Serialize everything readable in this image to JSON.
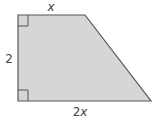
{
  "diagram": {
    "type": "right-trapezoid",
    "labels": {
      "top": "x",
      "left": "2",
      "bottom_coef": "2",
      "bottom_var": "x"
    },
    "colors": {
      "fill": "#d6d6d6",
      "stroke": "#555555",
      "text": "#444444"
    },
    "right_angle_markers": [
      "top-left",
      "bottom-left"
    ]
  }
}
